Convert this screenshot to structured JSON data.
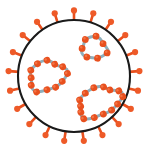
{
  "figure": {
    "title": "Influenza virus particle schematic",
    "caption": "",
    "background_color": "#ffffff"
  },
  "envelope": {
    "label": "viral envelope",
    "shape": "circle",
    "center_x": 74,
    "center_y": 76,
    "radius": 56,
    "stroke_color": "#1a1a1a",
    "stroke_width": 2.1,
    "fill_color": "#ffffff"
  },
  "spikes": {
    "label": "surface glycoprotein spikes",
    "count": 21,
    "stalk_color": "#E8501E",
    "stalk_width": 2.6,
    "head_color": "#EE5A28",
    "head_radius": 3.1,
    "stalk_length": 9,
    "angles_deg": [
      -90,
      -72.9,
      -55.7,
      -38.6,
      -21.4,
      -4.3,
      12.9,
      30,
      47.1,
      64.3,
      81.4,
      98.6,
      115.7,
      132.9,
      150,
      167.1,
      184.3,
      201.4,
      218.6,
      235.7,
      252.9
    ]
  },
  "ribonucleoproteins": [
    {
      "name": "rnp-left",
      "label": "ribonucleoprotein segment left",
      "center_x": 47,
      "center_y": 76,
      "radius_x": 18.5,
      "radius_y": 14.5,
      "rotation_deg": -18,
      "bead_count": 12,
      "bead_radius": 3.4,
      "ribbon_color": "#8FAEBA",
      "ribbon_width": 3.0,
      "bead_color": "#E8501E",
      "bead_highlight": "#F6794A"
    },
    {
      "name": "rnp-top-right",
      "label": "ribonucleoprotein segment top right",
      "center_x": 94,
      "center_y": 48,
      "radius_x": 12.5,
      "radius_y": 11.0,
      "rotation_deg": 8,
      "bead_count": 7,
      "bead_radius": 3.4,
      "ribbon_color": "#8FAEBA",
      "ribbon_width": 3.0,
      "bead_color": "#E8501E",
      "bead_highlight": "#F6794A"
    },
    {
      "name": "rnp-bottom-right",
      "label": "ribonucleoprotein segment bottom right",
      "center_x": 99,
      "center_y": 102,
      "radius_x": 22.0,
      "radius_y": 14.0,
      "rotation_deg": -22,
      "bead_count": 14,
      "bead_radius": 3.4,
      "ribbon_color": "#8FAEBA",
      "ribbon_width": 3.0,
      "bead_color": "#E8501E",
      "bead_highlight": "#F6794A"
    }
  ],
  "colors": {
    "orange": "#E8501E",
    "orange_light": "#F6794A",
    "blue_gray": "#8FAEBA",
    "outline": "#1a1a1a",
    "white": "#ffffff"
  }
}
